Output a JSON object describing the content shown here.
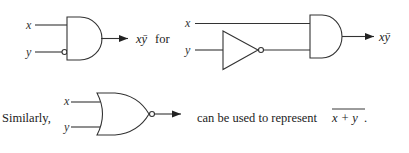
{
  "figure": {
    "row1": {
      "gate1": {
        "type": "AND gate with inverted y input",
        "inputs": [
          "x",
          "y"
        ],
        "output_label": "xȳ",
        "trailing_text": "for"
      },
      "gate2": {
        "type": "inverter on y feeding AND gate",
        "inputs": [
          "x",
          "y"
        ],
        "output_label": "xȳ"
      }
    },
    "row2": {
      "lead_text": "Similarly,",
      "gate": {
        "type": "NOR gate",
        "inputs": [
          "x",
          "y"
        ]
      },
      "trailing_text": "can be used to represent",
      "expression": "x + y",
      "expression_suffix": "."
    }
  }
}
